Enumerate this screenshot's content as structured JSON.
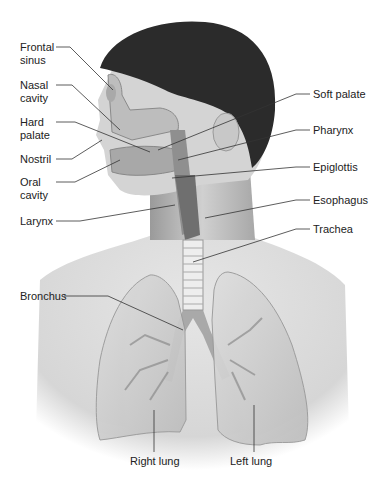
{
  "figure": {
    "labels_left": [
      {
        "id": "frontal-sinus",
        "line1": "Frontal",
        "line2": "sinus"
      },
      {
        "id": "nasal-cavity",
        "line1": "Nasal",
        "line2": "cavity"
      },
      {
        "id": "hard-palate",
        "line1": "Hard",
        "line2": "palate"
      },
      {
        "id": "nostril",
        "line1": "Nostril",
        "line2": ""
      },
      {
        "id": "oral-cavity",
        "line1": "Oral",
        "line2": "cavity"
      },
      {
        "id": "larynx",
        "line1": "Larynx",
        "line2": ""
      },
      {
        "id": "bronchus",
        "line1": "Bronchus",
        "line2": ""
      }
    ],
    "labels_right": [
      {
        "id": "soft-palate",
        "text": "Soft palate"
      },
      {
        "id": "pharynx",
        "text": "Pharynx"
      },
      {
        "id": "epiglottis",
        "text": "Epiglottis"
      },
      {
        "id": "esophagus",
        "text": "Esophagus"
      },
      {
        "id": "trachea",
        "text": "Trachea"
      }
    ],
    "labels_bottom": [
      {
        "id": "right-lung",
        "text": "Right lung"
      },
      {
        "id": "left-lung",
        "text": "Left lung"
      }
    ],
    "colors": {
      "skin": "#d9d9d9",
      "hair": "#2b2b2b",
      "lung": "#cfcfcf",
      "airway": "#7a7a7a",
      "leader_line": "#333333",
      "text": "#222222"
    }
  }
}
